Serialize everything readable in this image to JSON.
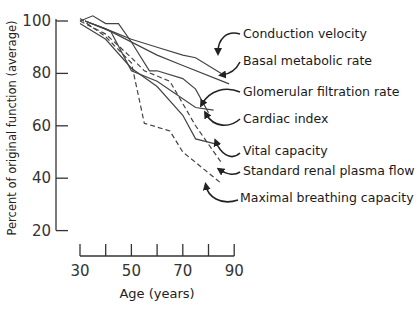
{
  "chart_data": {
    "type": "line",
    "title": "",
    "xlabel": "Age (years)",
    "ylabel": "Percent of original function (average)",
    "xlim": [
      30,
      90
    ],
    "ylim": [
      20,
      100
    ],
    "x_ticks": [
      30,
      40,
      50,
      60,
      70,
      80,
      90
    ],
    "x_tick_labels": [
      "30",
      "50",
      "70",
      "90"
    ],
    "y_ticks": [
      20,
      40,
      60,
      80,
      100
    ],
    "y_tick_labels": [
      "20",
      "40",
      "60",
      "80",
      "100"
    ],
    "grid": false,
    "legend_position": "right (inline labels with arrows)",
    "series": [
      {
        "name": "Conduction velocity",
        "style": "solid",
        "x": [
          32,
          40,
          50,
          60,
          70,
          75,
          85
        ],
        "values": [
          100,
          97,
          93,
          90,
          87,
          86,
          80
        ]
      },
      {
        "name": "Basal metabolic rate",
        "style": "solid",
        "x": [
          32,
          40,
          60,
          70,
          88
        ],
        "values": [
          100,
          97,
          87,
          83,
          76
        ]
      },
      {
        "name": "Glomerular filtration rate",
        "style": "solid",
        "x": [
          30,
          35,
          40,
          45,
          50,
          57,
          60,
          70,
          75,
          80
        ],
        "values": [
          100,
          102,
          99,
          99,
          92,
          81,
          81,
          78,
          74,
          65
        ]
      },
      {
        "name": "Cardiac index",
        "style": "solid",
        "x": [
          32,
          42,
          50,
          60,
          75,
          82
        ],
        "values": [
          100,
          96,
          81,
          77,
          67,
          66
        ]
      },
      {
        "name": "Vital capacity",
        "style": "solid",
        "x": [
          30,
          40,
          50,
          60,
          70,
          75,
          83
        ],
        "values": [
          99,
          93,
          82,
          75,
          64,
          55,
          53
        ]
      },
      {
        "name": "Standard renal plasma flow",
        "style": "dashed",
        "x": [
          30,
          40,
          50,
          55,
          65,
          75,
          85
        ],
        "values": [
          100,
          95,
          86,
          81,
          77,
          60,
          46
        ]
      },
      {
        "name": "Maximal breathing capacity",
        "style": "dashed",
        "x": [
          30,
          40,
          50,
          55,
          65,
          70,
          85
        ],
        "values": [
          101,
          94,
          84,
          61,
          58,
          50,
          38
        ]
      }
    ],
    "labels": [
      {
        "text": "Conduction velocity",
        "x": 243,
        "y": 38
      },
      {
        "text": "Basal metabolic rate",
        "x": 243,
        "y": 65
      },
      {
        "text": "Glomerular filtration rate",
        "x": 243,
        "y": 96
      },
      {
        "text": "Cardiac index",
        "x": 243,
        "y": 123
      },
      {
        "text": "Vital capacity",
        "x": 243,
        "y": 155
      },
      {
        "text": "Standard renal plasma flow",
        "x": 243,
        "y": 175
      },
      {
        "text": "Maximal breathing capacity",
        "x": 240,
        "y": 202
      }
    ],
    "colors": {
      "line": "#444444",
      "axis": "#333333",
      "background": "#ffffff"
    }
  }
}
